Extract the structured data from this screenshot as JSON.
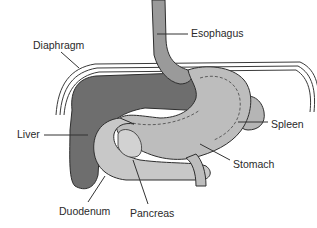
{
  "diagram": {
    "colors": {
      "background": "#ffffff",
      "liver": "#6e6e6e",
      "liver_dark": "#555555",
      "stomach": "#bdbdbd",
      "duodenum": "#c8c8c8",
      "esophagus": "#9a9a9a",
      "diaphragm_line": "#3a3a3a",
      "leader_line": "#333333",
      "text": "#2a2a2a"
    },
    "labels": [
      {
        "id": "esophagus",
        "text": "Esophagus",
        "x": 191,
        "y": 28
      },
      {
        "id": "diaphragm",
        "text": "Diaphragm",
        "x": 33,
        "y": 40
      },
      {
        "id": "liver",
        "text": "Liver",
        "x": 17,
        "y": 129
      },
      {
        "id": "spleen",
        "text": "Spleen",
        "x": 271,
        "y": 119
      },
      {
        "id": "stomach",
        "text": "Stomach",
        "x": 233,
        "y": 159
      },
      {
        "id": "duodenum",
        "text": "Duodenum",
        "x": 59,
        "y": 206
      },
      {
        "id": "pancreas",
        "text": "Pancreas",
        "x": 130,
        "y": 208
      }
    ]
  }
}
